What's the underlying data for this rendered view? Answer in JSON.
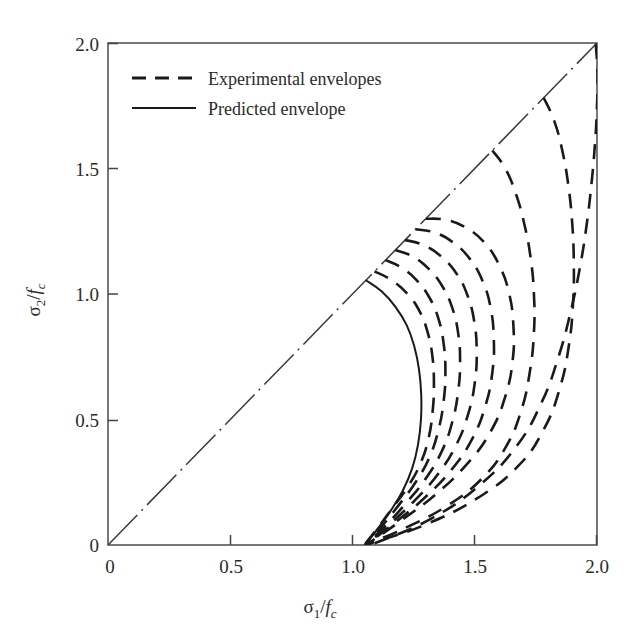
{
  "chart_data": {
    "type": "line",
    "title": "",
    "xlabel": "σ₁/f_c",
    "ylabel": "σ₂/f_c",
    "xlim": [
      0,
      2.0
    ],
    "ylim": [
      0,
      2.0
    ],
    "grid": false,
    "xticks": [
      0,
      0.5,
      1.0,
      1.5,
      2.0
    ],
    "yticks": [
      0,
      0.5,
      1.0,
      1.5,
      2.0
    ],
    "xtick_labels": [
      "0",
      "0.5",
      "1.0",
      "1.5",
      "2.0"
    ],
    "ytick_labels": [
      "0",
      "0.5",
      "1.0",
      "1.5",
      "2.0"
    ],
    "legend_position": "upper-left-inside",
    "series": [
      {
        "name": "Equal-biaxial diagonal",
        "style": "dash-dot",
        "points": [
          [
            0,
            0
          ],
          [
            2.0,
            2.0
          ]
        ]
      },
      {
        "name": "Predicted envelope",
        "style": "solid",
        "points": [
          [
            1.055,
            1.055
          ],
          [
            1.12,
            1.01
          ],
          [
            1.175,
            0.95
          ],
          [
            1.222,
            0.875
          ],
          [
            1.253,
            0.79
          ],
          [
            1.272,
            0.7
          ],
          [
            1.281,
            0.6
          ],
          [
            1.28,
            0.5
          ],
          [
            1.268,
            0.4
          ],
          [
            1.244,
            0.305
          ],
          [
            1.205,
            0.215
          ],
          [
            1.155,
            0.135
          ],
          [
            1.103,
            0.065
          ],
          [
            1.062,
            0.012
          ],
          [
            1.052,
            0.0
          ]
        ]
      },
      {
        "name": "Experimental envelope 1",
        "style": "dashed",
        "points": [
          [
            1.09,
            1.09
          ],
          [
            1.16,
            1.055
          ],
          [
            1.225,
            1.0
          ],
          [
            1.275,
            0.93
          ],
          [
            1.308,
            0.845
          ],
          [
            1.327,
            0.75
          ],
          [
            1.333,
            0.645
          ],
          [
            1.328,
            0.535
          ],
          [
            1.311,
            0.425
          ],
          [
            1.278,
            0.325
          ],
          [
            1.228,
            0.235
          ],
          [
            1.165,
            0.15
          ],
          [
            1.105,
            0.07
          ],
          [
            1.06,
            0.015
          ],
          [
            1.052,
            0.0
          ]
        ]
      },
      {
        "name": "Experimental envelope 2",
        "style": "dashed",
        "points": [
          [
            1.135,
            1.135
          ],
          [
            1.2,
            1.105
          ],
          [
            1.262,
            1.055
          ],
          [
            1.315,
            0.985
          ],
          [
            1.352,
            0.9
          ],
          [
            1.373,
            0.8
          ],
          [
            1.38,
            0.69
          ],
          [
            1.373,
            0.575
          ],
          [
            1.352,
            0.46
          ],
          [
            1.315,
            0.35
          ],
          [
            1.258,
            0.25
          ],
          [
            1.19,
            0.16
          ],
          [
            1.12,
            0.075
          ],
          [
            1.065,
            0.016
          ],
          [
            1.052,
            0.0
          ]
        ]
      },
      {
        "name": "Experimental envelope 3",
        "style": "dashed",
        "points": [
          [
            1.175,
            1.175
          ],
          [
            1.245,
            1.15
          ],
          [
            1.312,
            1.1
          ],
          [
            1.368,
            1.03
          ],
          [
            1.408,
            0.945
          ],
          [
            1.432,
            0.845
          ],
          [
            1.44,
            0.73
          ],
          [
            1.432,
            0.61
          ],
          [
            1.408,
            0.49
          ],
          [
            1.366,
            0.375
          ],
          [
            1.302,
            0.268
          ],
          [
            1.222,
            0.17
          ],
          [
            1.138,
            0.08
          ],
          [
            1.07,
            0.017
          ],
          [
            1.052,
            0.0
          ]
        ]
      },
      {
        "name": "Experimental envelope 4",
        "style": "dashed",
        "points": [
          [
            1.215,
            1.215
          ],
          [
            1.29,
            1.195
          ],
          [
            1.362,
            1.15
          ],
          [
            1.425,
            1.082
          ],
          [
            1.47,
            0.995
          ],
          [
            1.498,
            0.89
          ],
          [
            1.508,
            0.772
          ],
          [
            1.5,
            0.645
          ],
          [
            1.472,
            0.518
          ],
          [
            1.423,
            0.396
          ],
          [
            1.35,
            0.283
          ],
          [
            1.255,
            0.178
          ],
          [
            1.155,
            0.085
          ],
          [
            1.075,
            0.018
          ],
          [
            1.052,
            0.0
          ]
        ]
      },
      {
        "name": "Experimental envelope 5",
        "style": "dashed",
        "points": [
          [
            1.258,
            1.258
          ],
          [
            1.335,
            1.245
          ],
          [
            1.412,
            1.205
          ],
          [
            1.48,
            1.14
          ],
          [
            1.532,
            1.052
          ],
          [
            1.565,
            0.945
          ],
          [
            1.578,
            0.82
          ],
          [
            1.572,
            0.688
          ],
          [
            1.543,
            0.552
          ],
          [
            1.488,
            0.42
          ],
          [
            1.405,
            0.3
          ],
          [
            1.295,
            0.188
          ],
          [
            1.175,
            0.09
          ],
          [
            1.08,
            0.019
          ],
          [
            1.052,
            0.0
          ]
        ]
      },
      {
        "name": "Experimental envelope 6",
        "style": "dashed",
        "points": [
          [
            1.3,
            1.3
          ],
          [
            1.385,
            1.295
          ],
          [
            1.468,
            1.262
          ],
          [
            1.542,
            1.202
          ],
          [
            1.6,
            1.115
          ],
          [
            1.64,
            1.005
          ],
          [
            1.658,
            0.875
          ],
          [
            1.655,
            0.735
          ],
          [
            1.625,
            0.592
          ],
          [
            1.565,
            0.452
          ],
          [
            1.468,
            0.322
          ],
          [
            1.338,
            0.2
          ],
          [
            1.195,
            0.095
          ],
          [
            1.085,
            0.02
          ],
          [
            1.052,
            0.0
          ]
        ]
      },
      {
        "name": "Experimental envelope 7",
        "style": "dashed",
        "points": [
          [
            1.572,
            1.572
          ],
          [
            1.625,
            1.5
          ],
          [
            1.668,
            1.4
          ],
          [
            1.702,
            1.282
          ],
          [
            1.728,
            1.148
          ],
          [
            1.742,
            1.0
          ],
          [
            1.742,
            0.845
          ],
          [
            1.725,
            0.688
          ],
          [
            1.69,
            0.535
          ],
          [
            1.628,
            0.392
          ],
          [
            1.53,
            0.265
          ],
          [
            1.39,
            0.158
          ],
          [
            1.225,
            0.072
          ],
          [
            1.09,
            0.015
          ],
          [
            1.052,
            0.0
          ]
        ]
      },
      {
        "name": "Experimental envelope 8",
        "style": "dashed",
        "points": [
          [
            1.782,
            1.782
          ],
          [
            1.825,
            1.69
          ],
          [
            1.858,
            1.572
          ],
          [
            1.882,
            1.438
          ],
          [
            1.898,
            1.29
          ],
          [
            1.905,
            1.132
          ],
          [
            1.902,
            0.965
          ],
          [
            1.885,
            0.795
          ],
          [
            1.848,
            0.625
          ],
          [
            1.782,
            0.46
          ],
          [
            1.675,
            0.312
          ],
          [
            1.508,
            0.185
          ],
          [
            1.3,
            0.082
          ],
          [
            1.105,
            0.016
          ],
          [
            1.052,
            0.0
          ]
        ]
      },
      {
        "name": "Experimental envelope 9",
        "style": "dashed",
        "points": [
          [
            1.995,
            1.995
          ],
          [
            2.002,
            1.88
          ],
          [
            2.0,
            1.748
          ],
          [
            1.992,
            1.602
          ],
          [
            1.978,
            1.445
          ],
          [
            1.958,
            1.278
          ],
          [
            1.93,
            1.105
          ],
          [
            1.892,
            0.928
          ],
          [
            1.842,
            0.748
          ],
          [
            1.772,
            0.565
          ],
          [
            1.668,
            0.39
          ],
          [
            1.512,
            0.232
          ],
          [
            1.322,
            0.105
          ],
          [
            1.12,
            0.018
          ],
          [
            1.052,
            0.0
          ]
        ]
      }
    ],
    "legend": [
      {
        "label": "Experimental envelopes",
        "style": "dashed"
      },
      {
        "label": "Predicted envelope",
        "style": "solid"
      }
    ],
    "colors": {
      "line": "#1a1a1a",
      "axis": "#555555",
      "text": "#2b2b2b",
      "background": "#ffffff"
    }
  },
  "axes": {
    "x_title_base": "σ",
    "x_title_sub": "1",
    "x_title_den": "f",
    "x_title_den_sub": "c",
    "y_title_base": "σ",
    "y_title_sub": "2",
    "y_title_den": "f",
    "y_title_den_sub": "c",
    "slash": "/"
  }
}
